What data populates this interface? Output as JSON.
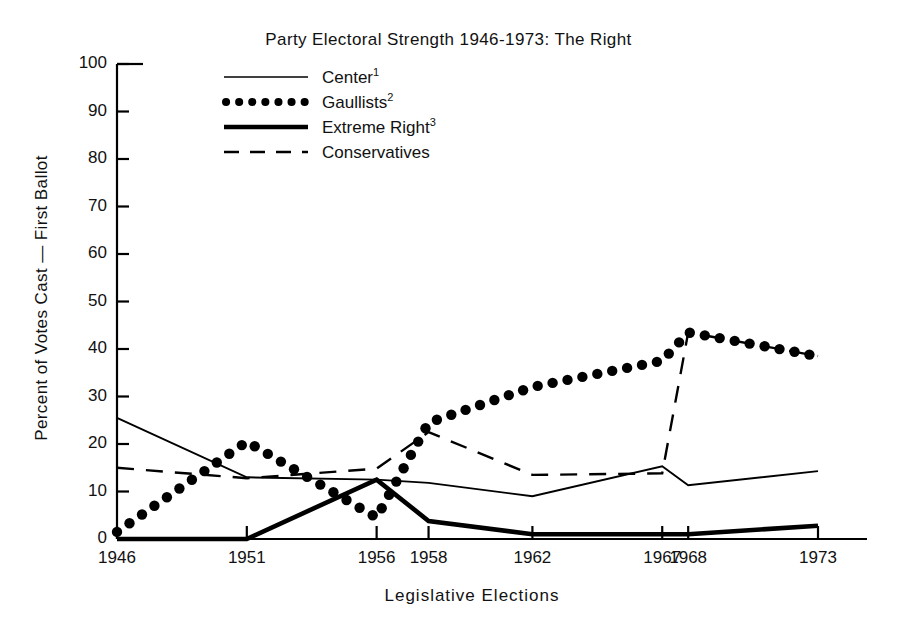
{
  "chart_data": {
    "type": "line",
    "title": "Party Electoral Strength 1946-1973: The Right",
    "xlabel": "Legislative Elections",
    "ylabel": "Percent of Votes Cast — First Ballot",
    "categories": [
      "1946",
      "1951",
      "1956",
      "1958",
      "1962",
      "1967",
      "1968",
      "1973"
    ],
    "x_tick_labels": [
      "1946",
      "1951",
      "1956",
      "1958",
      "1962",
      "1967",
      "1968",
      "1973"
    ],
    "y_tick_labels": [
      "0",
      "10",
      "20",
      "30",
      "40",
      "50",
      "60",
      "70",
      "80",
      "90",
      "100"
    ],
    "ylim": [
      0,
      100
    ],
    "ytick_step": 10,
    "grid": false,
    "legend_position": "top-left-inside",
    "series": [
      {
        "name": "Center",
        "footnote": "1",
        "style": "solid-thin",
        "values": [
          25.5,
          13.0,
          12.5,
          11.8,
          9.0,
          15.3,
          11.3,
          14.3
        ]
      },
      {
        "name": "Gaullists",
        "footnote": "2",
        "style": "dotted",
        "values": [
          1.5,
          20.5,
          4.5,
          24.5,
          32.0,
          37.5,
          43.5,
          38.5
        ]
      },
      {
        "name": "Extreme Right",
        "footnote": "3",
        "style": "solid-thick",
        "values": [
          0.0,
          0.0,
          12.5,
          3.8,
          1.0,
          1.0,
          1.0,
          2.8
        ]
      },
      {
        "name": "Conservatives",
        "footnote": "",
        "style": "dashed",
        "values": [
          15.0,
          12.8,
          14.8,
          22.5,
          13.5,
          13.8,
          43.5,
          38.5
        ]
      }
    ]
  },
  "legend": {
    "items": [
      {
        "label": "Center",
        "sup": "1"
      },
      {
        "label": "Gaullists",
        "sup": "2"
      },
      {
        "label": "Extreme Right",
        "sup": "3"
      },
      {
        "label": "Conservatives",
        "sup": ""
      }
    ]
  },
  "colors": {
    "ink": "#000000",
    "background": "#ffffff"
  }
}
